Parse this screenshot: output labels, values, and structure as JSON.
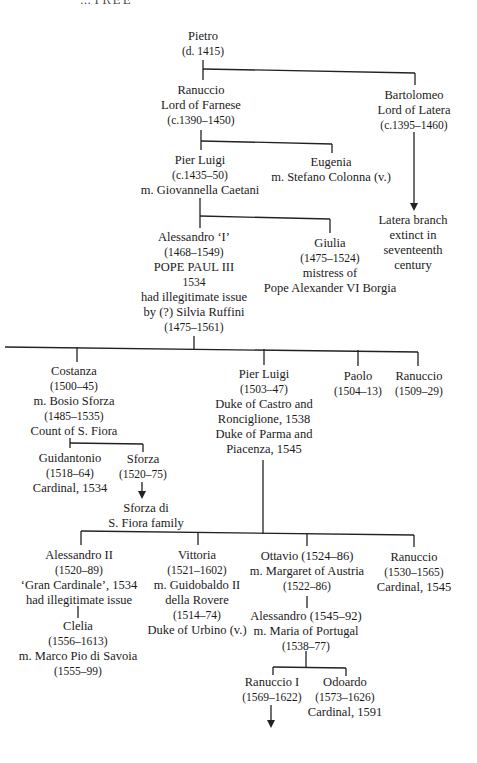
{
  "header": {
    "title": "…TREE"
  },
  "nodes": {
    "pietro": [
      "Pietro",
      "(d. 1415)"
    ],
    "ranuccio_lord": [
      "Ranuccio",
      "Lord of Farnese",
      "(c.1390–1450)"
    ],
    "bartolomeo": [
      "Bartolomeo",
      "Lord of Latera",
      "(c.1395–1460)"
    ],
    "latera": [
      "Latera branch",
      "extinct in",
      "seventeenth",
      "century"
    ],
    "pier_luigi_elder": [
      "Pier Luigi",
      "(c.1435–50)",
      "m. Giovannella Caetani"
    ],
    "eugenia": [
      "Eugenia",
      "m. Stefano Colonna (v.)"
    ],
    "alessandro_i": [
      "Alessandro ‘I’",
      "(1468–1549)",
      "POPE PAUL III",
      "1534",
      "had illegitimate issue",
      "by (?) Silvia Ruffini",
      "(1475–1561)"
    ],
    "giulia": [
      "Giulia",
      "(1475–1524)",
      "mistress of",
      "Pope Alexander VI Borgia"
    ],
    "costanza": [
      "Costanza",
      "(1500–45)",
      "m. Bosio Sforza",
      "(1485–1535)",
      "Count of S. Fiora"
    ],
    "pier_luigi_duke": [
      "Pier Luigi",
      "(1503–47)",
      "Duke of Castro and",
      "Ronciglione, 1538",
      "Duke of Parma and",
      "Piacenza, 1545"
    ],
    "paolo": [
      "Paolo",
      "(1504–13)"
    ],
    "ranuccio_1509": [
      "Ranuccio",
      "(1509–29)"
    ],
    "guidantonio": [
      "Guidantonio",
      "(1518–64)",
      "Cardinal, 1534"
    ],
    "sforza": [
      "Sforza",
      "(1520–75)"
    ],
    "sforza_family": [
      "Sforza di",
      "S. Fiora family"
    ],
    "alessandro_ii": [
      "Alessandro II",
      "(1520–89)",
      "‘Gran Cardinale’, 1534",
      "had illegitimate issue"
    ],
    "clelia": [
      "Clelia",
      "(1556–1613)",
      "m. Marco Pio di Savoia",
      "(1555–99)"
    ],
    "vittoria": [
      "Vittoria",
      "(1521–1602)",
      "m. Guidobaldo II",
      "della Rovere",
      "(1514–74)",
      "Duke of Urbino (v.)"
    ],
    "ottavio": [
      "Ottavio (1524–86)",
      "m. Margaret of Austria",
      "(1522–86)"
    ],
    "ranuccio_card": [
      "Ranuccio",
      "(1530–1565)",
      "Cardinal, 1545"
    ],
    "alessandro_1545": [
      "Alessandro (1545–92)",
      "m. Maria of Portugal",
      "(1538–77)"
    ],
    "ranuccio_i": [
      "Ranuccio I",
      "(1569–1622)"
    ],
    "odoardo": [
      "Odoardo",
      "(1573–1626)",
      "Cardinal, 1591"
    ]
  }
}
